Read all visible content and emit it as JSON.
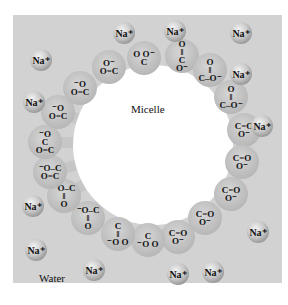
{
  "diagram": {
    "title_label": "Micelle",
    "water_label": "Water",
    "colors": {
      "background": "#ffffff",
      "panel": "#d2d2d2",
      "tail": "#c6c6c6",
      "head": "#bdbdbd",
      "core": "#ffffff",
      "text": "#111111"
    },
    "center": {
      "x": 153,
      "y": 145
    },
    "head_count": 20,
    "heads": [
      {
        "id": 1,
        "x": 182,
        "y": 56,
        "text": [
          "O",
          "‖",
          "C",
          "O⁻"
        ],
        "group": "carboxylate"
      },
      {
        "id": 2,
        "x": 210,
        "y": 70,
        "text": [
          "O",
          "‖",
          "C–O⁻"
        ],
        "group": "carboxylate"
      },
      {
        "id": 3,
        "x": 231,
        "y": 97,
        "text": [
          "O",
          "‖",
          "C–O⁻"
        ],
        "group": "carboxylate"
      },
      {
        "id": 4,
        "x": 244,
        "y": 130,
        "text": [
          "C=O",
          "O⁻"
        ],
        "group": "carboxylate"
      },
      {
        "id": 5,
        "x": 242,
        "y": 162,
        "text": [
          "C=O",
          "O⁻"
        ],
        "group": "carboxylate"
      },
      {
        "id": 6,
        "x": 231,
        "y": 194,
        "text": [
          "C=O",
          "O⁻"
        ],
        "group": "carboxylate"
      },
      {
        "id": 7,
        "x": 205,
        "y": 218,
        "text": [
          "C=O",
          "O⁻"
        ],
        "group": "carboxylate"
      },
      {
        "id": 8,
        "x": 178,
        "y": 237,
        "text": [
          "C=O",
          "O⁻"
        ],
        "group": "carboxylate"
      },
      {
        "id": 9,
        "x": 148,
        "y": 240,
        "text": [
          "C",
          "⁻O O"
        ],
        "group": "carboxylate"
      },
      {
        "id": 10,
        "x": 118,
        "y": 234,
        "text": [
          "C",
          "‖",
          "⁻O O"
        ],
        "group": "carboxylate"
      },
      {
        "id": 11,
        "x": 88,
        "y": 218,
        "text": [
          "⁻O–C",
          "‖",
          "O"
        ],
        "group": "carboxylate"
      },
      {
        "id": 12,
        "x": 64,
        "y": 196,
        "text": [
          "⁻O–C",
          "‖",
          "O"
        ],
        "group": "carboxylate"
      },
      {
        "id": 13,
        "x": 50,
        "y": 172,
        "text": [
          "⁻O–C",
          "O=C"
        ],
        "group": "carboxylate"
      },
      {
        "id": 14,
        "x": 45,
        "y": 142,
        "text": [
          "⁻O",
          "C",
          "O=C"
        ],
        "group": "carboxylate"
      },
      {
        "id": 15,
        "x": 58,
        "y": 112,
        "text": [
          "⁻O",
          "O=C"
        ],
        "group": "carboxylate"
      },
      {
        "id": 16,
        "x": 80,
        "y": 88,
        "text": [
          "⁻O",
          "O=C"
        ],
        "group": "carboxylate"
      },
      {
        "id": 17,
        "x": 109,
        "y": 67,
        "text": [
          "O⁻",
          "O=C"
        ],
        "group": "carboxylate"
      },
      {
        "id": 18,
        "x": 144,
        "y": 58,
        "text": [
          "O O⁻",
          "C"
        ],
        "group": "carboxylate"
      }
    ],
    "sodium_ions": [
      {
        "x": 124,
        "y": 33,
        "label": "Na⁺"
      },
      {
        "x": 175,
        "y": 31,
        "label": "Na⁺"
      },
      {
        "x": 241,
        "y": 33,
        "label": "Na⁺"
      },
      {
        "x": 41,
        "y": 60,
        "label": "Na⁺"
      },
      {
        "x": 241,
        "y": 74,
        "label": "Na⁺"
      },
      {
        "x": 34,
        "y": 102,
        "label": "Na⁺"
      },
      {
        "x": 262,
        "y": 126,
        "label": "Na⁺"
      },
      {
        "x": 33,
        "y": 206,
        "label": "Na⁺"
      },
      {
        "x": 258,
        "y": 232,
        "label": "Na⁺"
      },
      {
        "x": 36,
        "y": 250,
        "label": "Na⁺"
      },
      {
        "x": 94,
        "y": 270,
        "label": "Na⁺"
      },
      {
        "x": 178,
        "y": 274,
        "label": "Na⁺"
      },
      {
        "x": 213,
        "y": 272,
        "label": "Na⁺"
      }
    ]
  }
}
